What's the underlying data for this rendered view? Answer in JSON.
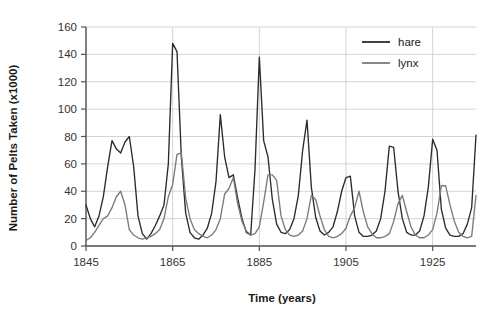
{
  "chart_data": {
    "type": "line",
    "title": "",
    "xlabel": "Time (years)",
    "ylabel": "Number of Pelts Taken (x1000)",
    "xlim": [
      1845,
      1935
    ],
    "ylim": [
      0,
      160
    ],
    "xticks": [
      1845,
      1865,
      1885,
      1905,
      1925
    ],
    "yticks": [
      0,
      20,
      40,
      60,
      80,
      100,
      120,
      140,
      160
    ],
    "grid": true,
    "legend_position": "top-right",
    "x": [
      1845,
      1846,
      1847,
      1848,
      1849,
      1850,
      1851,
      1852,
      1853,
      1854,
      1855,
      1856,
      1857,
      1858,
      1859,
      1860,
      1861,
      1862,
      1863,
      1864,
      1865,
      1866,
      1867,
      1868,
      1869,
      1870,
      1871,
      1872,
      1873,
      1874,
      1875,
      1876,
      1877,
      1878,
      1879,
      1880,
      1881,
      1882,
      1883,
      1884,
      1885,
      1886,
      1887,
      1888,
      1889,
      1890,
      1891,
      1892,
      1893,
      1894,
      1895,
      1896,
      1897,
      1898,
      1899,
      1900,
      1901,
      1902,
      1903,
      1904,
      1905,
      1906,
      1907,
      1908,
      1909,
      1910,
      1911,
      1912,
      1913,
      1914,
      1915,
      1916,
      1917,
      1918,
      1919,
      1920,
      1921,
      1922,
      1923,
      1924,
      1925,
      1926,
      1927,
      1928,
      1929,
      1930,
      1931,
      1932,
      1933,
      1934,
      1935
    ],
    "series": [
      {
        "name": "hare",
        "color": "#2b2b2b",
        "values": [
          30,
          20,
          14,
          22,
          36,
          58,
          77,
          71,
          68,
          76,
          80,
          58,
          22,
          9,
          5,
          9,
          15,
          22,
          30,
          60,
          148,
          142,
          65,
          24,
          10,
          6,
          5,
          8,
          13,
          24,
          47,
          96,
          65,
          50,
          52,
          35,
          20,
          10,
          8,
          56,
          138,
          77,
          65,
          34,
          16,
          10,
          9,
          12,
          20,
          37,
          70,
          92,
          43,
          21,
          11,
          8,
          10,
          14,
          25,
          40,
          50,
          51,
          22,
          10,
          7,
          7,
          8,
          11,
          20,
          40,
          73,
          72,
          40,
          20,
          10,
          8,
          8,
          11,
          22,
          43,
          78,
          70,
          27,
          13,
          8,
          7,
          7,
          9,
          16,
          28,
          81
        ]
      },
      {
        "name": "lynx",
        "color": "#7a7a7a",
        "values": [
          4,
          6,
          10,
          15,
          20,
          22,
          28,
          36,
          40,
          30,
          12,
          8,
          6,
          5,
          6,
          7,
          9,
          12,
          20,
          36,
          45,
          67,
          68,
          35,
          20,
          12,
          9,
          7,
          6,
          8,
          12,
          20,
          38,
          42,
          50,
          31,
          18,
          11,
          8,
          9,
          14,
          32,
          52,
          52,
          48,
          22,
          12,
          8,
          7,
          8,
          11,
          20,
          37,
          34,
          22,
          12,
          7,
          6,
          7,
          9,
          13,
          22,
          28,
          40,
          25,
          14,
          9,
          6,
          6,
          7,
          9,
          18,
          31,
          37,
          25,
          14,
          8,
          6,
          6,
          8,
          12,
          24,
          44,
          44,
          30,
          18,
          10,
          7,
          6,
          7,
          37
        ]
      }
    ]
  },
  "legend": {
    "items": [
      {
        "label": "hare"
      },
      {
        "label": "lynx"
      }
    ]
  },
  "axes": {
    "x_title": "Time (years)",
    "y_title": "Number of Pelts Taken (x1000)",
    "x_tick_labels": [
      "1845",
      "1865",
      "1885",
      "1905",
      "1925"
    ],
    "y_tick_labels": [
      "0",
      "20",
      "40",
      "60",
      "80",
      "100",
      "120",
      "140",
      "160"
    ]
  },
  "colors": {
    "hare": "#2b2b2b",
    "lynx": "#7a7a7a",
    "grid": "#c9c9c9",
    "axis": "#555555",
    "background": "#ffffff"
  }
}
